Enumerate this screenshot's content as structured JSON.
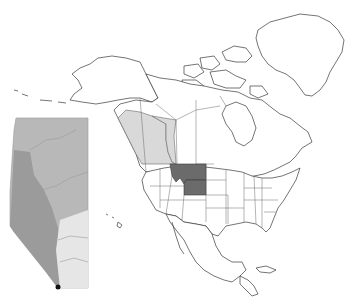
{
  "figure": {
    "type": "range-map",
    "subject_region": "North America",
    "colors": {
      "background": "#ffffff",
      "land": "#ffffff",
      "outline": "#3a3a3a",
      "range_light": "#d9d9d9",
      "range_dark": "#6b6b6b",
      "inset_base": "#b8b8b8",
      "inset_mountain": "#8e8e8e",
      "inset_plain": "#e6e6e6",
      "marker": "#111111"
    },
    "highlighted_regions": [
      {
        "name": "British Columbia",
        "shade": "light"
      },
      {
        "name": "Alberta",
        "shade": "light"
      },
      {
        "name": "Montana",
        "shade": "dark"
      },
      {
        "name": "Wyoming",
        "shade": "dark"
      }
    ],
    "inset": {
      "region": "Alberta",
      "position": "left",
      "marker": {
        "description": "black dot at southwestern corner"
      }
    }
  }
}
